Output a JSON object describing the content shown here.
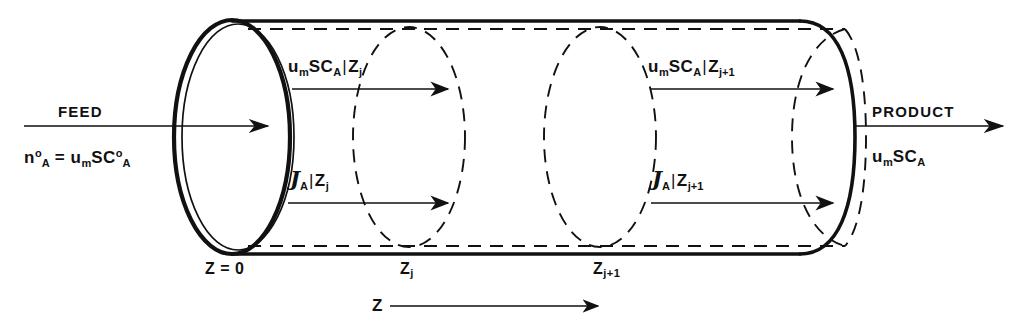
{
  "figure": {
    "colors": {
      "ink": "#111111",
      "background": "#ffffff"
    }
  },
  "inlet": {
    "stream_label": "FEED",
    "molar_flow": {
      "symbol": "n",
      "subscript": "A",
      "superscript": "o"
    },
    "equals": "=",
    "expression": {
      "velocity": "u",
      "velocity_sub": "m",
      "area": "S",
      "conc": "C",
      "conc_sub": "A",
      "conc_sup": "o"
    }
  },
  "outlet": {
    "stream_label": "PRODUCT",
    "expression": {
      "velocity": "u",
      "velocity_sub": "m",
      "area": "S",
      "conc": "C",
      "conc_sub": "A"
    }
  },
  "convective_terms": [
    {
      "name": "convective-flux-zj",
      "velocity": "u",
      "velocity_sub": "m",
      "area": "S",
      "conc": "C",
      "conc_sub": "A",
      "bar": "|",
      "eval_at": "Z",
      "eval_sub": "j"
    },
    {
      "name": "convective-flux-zj1",
      "velocity": "u",
      "velocity_sub": "m",
      "area": "S",
      "conc": "C",
      "conc_sub": "A",
      "bar": "|",
      "eval_at": "Z",
      "eval_sub": "j+1"
    }
  ],
  "diffusive_terms": [
    {
      "name": "diffusive-flux-zj",
      "symbol": "J",
      "species_sub": "A",
      "bar": "|",
      "eval_at": "Z",
      "eval_sub": "j"
    },
    {
      "name": "diffusive-flux-zj1",
      "symbol": "J",
      "species_sub": "A",
      "bar": "|",
      "eval_at": "Z",
      "eval_sub": "j+1"
    }
  ],
  "axis": {
    "label": "Z",
    "positions": [
      {
        "name": "position-origin",
        "text": "Z = 0"
      },
      {
        "name": "position-zj",
        "symbol": "Z",
        "sub": "j"
      },
      {
        "name": "position-zj1",
        "symbol": "Z",
        "sub": "j+1"
      }
    ]
  }
}
